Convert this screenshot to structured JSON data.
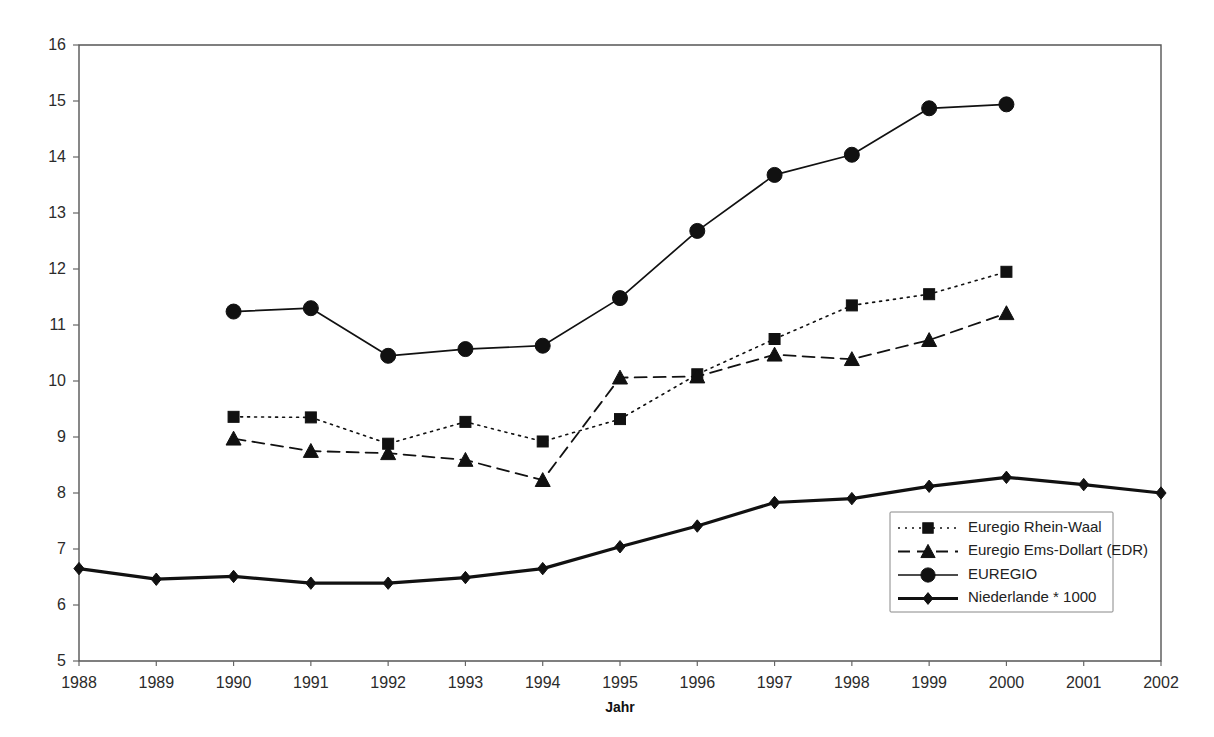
{
  "chart_data": {
    "type": "line",
    "title": "",
    "xlabel": "Jahr",
    "ylabel": "",
    "x": [
      1988,
      1989,
      1990,
      1991,
      1992,
      1993,
      1994,
      1995,
      1996,
      1997,
      1998,
      1999,
      2000,
      2001,
      2002
    ],
    "x_tick_labels": [
      "1988",
      "1989",
      "1990",
      "1991",
      "1992",
      "1993",
      "1994",
      "1995",
      "1996",
      "1997",
      "1998",
      "1999",
      "2000",
      "2001",
      "2002"
    ],
    "y_tick_labels": [
      "16",
      "15",
      "14",
      "13",
      "12",
      "11",
      "10",
      "9",
      "8",
      "7",
      "6",
      "5"
    ],
    "ylim": [
      5,
      16
    ],
    "xlim": [
      1988,
      2002
    ],
    "y_ticks": [
      5,
      6,
      7,
      8,
      9,
      10,
      11,
      12,
      13,
      14,
      15,
      16
    ],
    "grid": false,
    "legend_position": "bottom-right",
    "series": [
      {
        "name": "Euregio Rhein-Waal",
        "marker": "square",
        "line_style": "dotted",
        "line_width": 1.6,
        "color": "#111111",
        "x": [
          1990,
          1991,
          1992,
          1993,
          1994,
          1995,
          1996,
          1997,
          1998,
          1999,
          2000
        ],
        "values": [
          9.36,
          9.35,
          8.88,
          9.27,
          8.92,
          9.32,
          10.12,
          10.75,
          11.35,
          11.55,
          11.95
        ]
      },
      {
        "name": "Euregio Ems-Dollart (EDR)",
        "marker": "triangle",
        "line_style": "dashed",
        "line_width": 1.8,
        "color": "#111111",
        "x": [
          1990,
          1991,
          1992,
          1993,
          1994,
          1995,
          1996,
          1997,
          1998,
          1999,
          2000
        ],
        "values": [
          8.97,
          8.75,
          8.71,
          8.59,
          8.23,
          10.06,
          10.08,
          10.47,
          10.39,
          10.73,
          11.21
        ]
      },
      {
        "name": "EUREGIO",
        "marker": "circle",
        "line_style": "solid",
        "line_width": 1.7,
        "color": "#111111",
        "x": [
          1990,
          1991,
          1992,
          1993,
          1994,
          1995,
          1996,
          1997,
          1998,
          1999,
          2000
        ],
        "values": [
          11.24,
          11.3,
          10.45,
          10.57,
          10.63,
          11.48,
          12.68,
          13.68,
          14.04,
          14.87,
          14.94
        ]
      },
      {
        "name": "Niederlande * 1000",
        "marker": "diamond",
        "line_style": "solid",
        "line_width": 3.2,
        "color": "#111111",
        "x": [
          1988,
          1989,
          1990,
          1991,
          1992,
          1993,
          1994,
          1995,
          1996,
          1997,
          1998,
          1999,
          2000,
          2001,
          2002
        ],
        "values": [
          6.65,
          6.46,
          6.51,
          6.39,
          6.39,
          6.49,
          6.65,
          7.04,
          7.41,
          7.83,
          7.9,
          8.12,
          8.28,
          8.15,
          8.0
        ]
      }
    ]
  },
  "legend": {
    "items": [
      {
        "label": "Euregio Rhein-Waal"
      },
      {
        "label": "Euregio Ems-Dollart (EDR)"
      },
      {
        "label": "EUREGIO"
      },
      {
        "label": "Niederlande * 1000"
      }
    ]
  },
  "axes": {
    "x_title": "Jahr"
  },
  "colors": {
    "foreground": "#111111",
    "axis": "#555555",
    "background": "#ffffff"
  }
}
